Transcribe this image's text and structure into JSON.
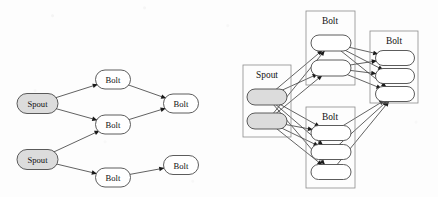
{
  "figure": {
    "title": "",
    "background_color": "#fdfdfd",
    "stroke_color": "#3a3a3a",
    "node_fill_spout": "#dcdcdc",
    "node_fill_bolt": "#ffffff",
    "group_border_color": "#8c8c8c"
  },
  "diagrams": [
    {
      "id": "topology-logical",
      "name": "logical-topology",
      "nodes": [
        {
          "id": "L-spout-1",
          "label": "Spout",
          "kind": "spout",
          "x": 37.5,
          "y": 103.5,
          "w": 41,
          "h": 20
        },
        {
          "id": "L-spout-2",
          "label": "Spout",
          "kind": "spout",
          "x": 37.5,
          "y": 159.5,
          "w": 41,
          "h": 20
        },
        {
          "id": "L-bolt-1",
          "label": "Bolt",
          "kind": "bolt",
          "x": 113,
          "y": 79.5,
          "w": 35,
          "h": 19
        },
        {
          "id": "L-bolt-2",
          "label": "Bolt",
          "kind": "bolt",
          "x": 113,
          "y": 124.5,
          "w": 35,
          "h": 19
        },
        {
          "id": "L-bolt-3",
          "label": "Bolt",
          "kind": "bolt",
          "x": 181,
          "y": 103.5,
          "w": 35,
          "h": 19
        },
        {
          "id": "L-bolt-4",
          "label": "Bolt",
          "kind": "bolt",
          "x": 113,
          "y": 177.5,
          "w": 35,
          "h": 19
        },
        {
          "id": "L-bolt-5",
          "label": "Bolt",
          "kind": "bolt",
          "x": 181,
          "y": 165.0,
          "w": 35,
          "h": 19
        }
      ],
      "edges": [
        {
          "from": "L-spout-1",
          "to": "L-bolt-1"
        },
        {
          "from": "L-spout-1",
          "to": "L-bolt-2"
        },
        {
          "from": "L-spout-2",
          "to": "L-bolt-2"
        },
        {
          "from": "L-spout-2",
          "to": "L-bolt-4"
        },
        {
          "from": "L-bolt-1",
          "to": "L-bolt-3"
        },
        {
          "from": "L-bolt-2",
          "to": "L-bolt-3"
        },
        {
          "from": "L-bolt-4",
          "to": "L-bolt-5"
        }
      ]
    },
    {
      "id": "topology-physical",
      "name": "task-level-topology",
      "groups": [
        {
          "id": "R-spout-grp",
          "label": "Spout",
          "kind": "spout",
          "x": 243,
          "y": 65,
          "w": 48,
          "h": 72,
          "label_x": 267,
          "label_y": 75,
          "tasks": [
            {
              "id": "R-s1",
              "cx": 267,
              "cy": 97,
              "w": 40,
              "h": 16
            },
            {
              "id": "R-s2",
              "cx": 267,
              "cy": 121,
              "w": 40,
              "h": 16
            }
          ]
        },
        {
          "id": "R-bolt-grp-A",
          "label": "Bolt",
          "kind": "bolt",
          "x": 306,
          "y": 11,
          "w": 49,
          "h": 74,
          "label_x": 330,
          "label_y": 21,
          "tasks": [
            {
              "id": "R-a1",
              "cx": 331,
              "cy": 43,
              "w": 40,
              "h": 16
            },
            {
              "id": "R-a2",
              "cx": 331,
              "cy": 68,
              "w": 40,
              "h": 16
            }
          ]
        },
        {
          "id": "R-bolt-grp-B",
          "label": "Bolt",
          "kind": "bolt",
          "x": 306,
          "y": 107,
          "w": 49,
          "h": 81,
          "label_x": 330,
          "label_y": 117,
          "tasks": [
            {
              "id": "R-b1",
              "cx": 331,
              "cy": 133,
              "w": 40,
              "h": 15
            },
            {
              "id": "R-b2",
              "cx": 331,
              "cy": 152,
              "w": 40,
              "h": 15
            },
            {
              "id": "R-b3",
              "cx": 331,
              "cy": 172,
              "w": 40,
              "h": 15
            }
          ]
        },
        {
          "id": "R-bolt-grp-C",
          "label": "Bolt",
          "kind": "bolt",
          "x": 370,
          "y": 31,
          "w": 48,
          "h": 72,
          "label_x": 394,
          "label_y": 41,
          "tasks": [
            {
              "id": "R-c1",
              "cx": 395,
              "cy": 58,
              "w": 39,
              "h": 15
            },
            {
              "id": "R-c2",
              "cx": 395,
              "cy": 76,
              "w": 39,
              "h": 15
            },
            {
              "id": "R-c3",
              "cx": 395,
              "cy": 94,
              "w": 39,
              "h": 15
            }
          ]
        }
      ],
      "edges": [
        {
          "from": "R-s1",
          "to": "R-a1"
        },
        {
          "from": "R-s1",
          "to": "R-a2"
        },
        {
          "from": "R-s1",
          "to": "R-b1"
        },
        {
          "from": "R-s1",
          "to": "R-b2"
        },
        {
          "from": "R-s1",
          "to": "R-b3"
        },
        {
          "from": "R-s2",
          "to": "R-a1"
        },
        {
          "from": "R-s2",
          "to": "R-a2"
        },
        {
          "from": "R-s2",
          "to": "R-b1"
        },
        {
          "from": "R-s2",
          "to": "R-b2"
        },
        {
          "from": "R-s2",
          "to": "R-b3"
        },
        {
          "from": "R-a1",
          "to": "R-c1"
        },
        {
          "from": "R-a1",
          "to": "R-c2"
        },
        {
          "from": "R-a1",
          "to": "R-c3"
        },
        {
          "from": "R-a2",
          "to": "R-c1"
        },
        {
          "from": "R-a2",
          "to": "R-c2"
        },
        {
          "from": "R-a2",
          "to": "R-c3"
        },
        {
          "from": "R-b1",
          "to": "R-c3"
        },
        {
          "from": "R-b2",
          "to": "R-c3"
        },
        {
          "from": "R-b3",
          "to": "R-c3"
        }
      ]
    }
  ]
}
